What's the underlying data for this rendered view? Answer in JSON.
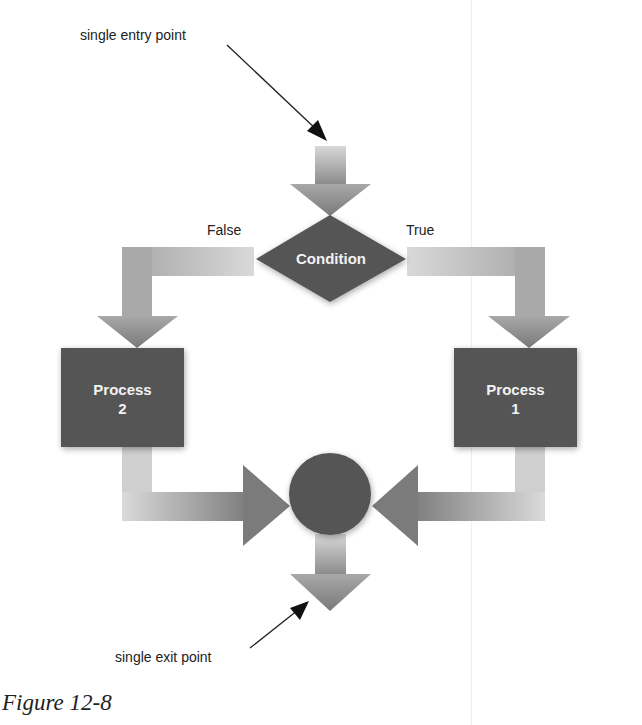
{
  "diagram": {
    "type": "flowchart",
    "entry_label": "single entry point",
    "exit_label": "single exit point",
    "condition": {
      "label": "Condition"
    },
    "branches": {
      "false_label": "False",
      "true_label": "True"
    },
    "process_left": {
      "line1": "Process",
      "line2": "2"
    },
    "process_right": {
      "line1": "Process",
      "line2": "1"
    },
    "caption": "Figure 12-8",
    "colors": {
      "node_fill": "#555555",
      "arrow_dark": "#7a7a7a",
      "arrow_light": "#d6d6d6",
      "text_on_node": "#f2f2f2",
      "label_text": "#222222"
    }
  }
}
